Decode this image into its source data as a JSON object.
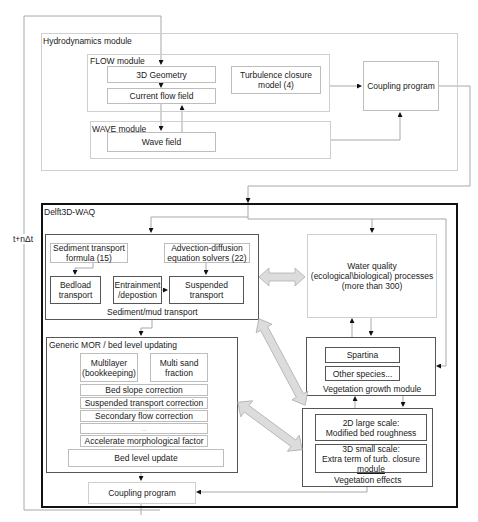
{
  "loop_label": "t+nΔt",
  "hydrodynamics": {
    "title": "Hydrodynamics module",
    "flow": {
      "title": "FLOW module",
      "geometry": "3D Geometry",
      "current_flow": "Current flow field",
      "turbulence_line1": "Turbulence closure",
      "turbulence_line2": "model (4)"
    },
    "wave": {
      "title": "WAVE module",
      "wave_field": "Wave field"
    },
    "coupling": "Coupling program"
  },
  "waq": {
    "title": "Delft3D-WAQ",
    "sediment": {
      "title": "Sediment/mud transport",
      "formula_line1": "Sediment transport",
      "formula_line2": "formula (15)",
      "advection_line1": "Advection-diffusion",
      "advection_line2": "equation solvers (22)",
      "bedload_line1": "Bedload",
      "bedload_line2": "transport",
      "entrainment_line1": "Entrainment",
      "entrainment_line2": "/depostion",
      "suspended_line1": "Suspended",
      "suspended_line2": "transport"
    },
    "mor": {
      "title": "Generic MOR / bed level updating",
      "multilayer_line1": "Multilayer",
      "multilayer_line2": "(bookkeeping)",
      "multisand_line1": "Multi sand",
      "multisand_line2": "fraction",
      "rows": [
        "Bed slope correction",
        "Suspended transport correction",
        "Secondary flow correction",
        "...",
        "Accelerate morphological factor"
      ],
      "bed_level_update": "Bed level update"
    },
    "water_quality": {
      "line1": "Water quality",
      "line2": "(ecological\\biological) processes",
      "line3": "(more than 300)"
    },
    "vegetation_growth": {
      "title": "Vegetation growth module",
      "species1": "Spartina",
      "species2": "Other species..."
    },
    "vegetation_effects": {
      "title": "Vegetation effects",
      "large_line1": "2D large scale:",
      "large_line2": "Modified bed roughness",
      "small_line1": "3D small scale:",
      "small_line2": "Extra term of turb. closure",
      "small_line3": "module"
    },
    "coupling": "Coupling program"
  },
  "colors": {
    "line": "#9a9a9a",
    "arrow_fill": "#dcdcdc",
    "arrow_stroke": "#b5b5b5",
    "frame": "#111111"
  }
}
